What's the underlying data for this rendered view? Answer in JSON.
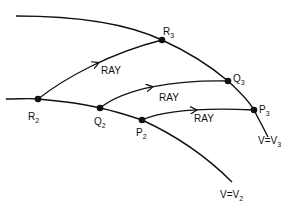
{
  "diagram": {
    "curves": {
      "front_v3_label": "V=V",
      "front_v3_sub": "3",
      "front_v2_label": "V=V",
      "front_v2_sub": "2"
    },
    "points": [
      {
        "id": "R2",
        "label": "R",
        "sub": "2"
      },
      {
        "id": "Q2",
        "label": "Q",
        "sub": "2"
      },
      {
        "id": "P2",
        "label": "P",
        "sub": "2"
      },
      {
        "id": "R3",
        "label": "R",
        "sub": "3"
      },
      {
        "id": "Q3",
        "label": "Q",
        "sub": "3"
      },
      {
        "id": "P3",
        "label": "P",
        "sub": "3"
      }
    ],
    "rays": [
      {
        "from": "R2",
        "to": "R3",
        "label": "RAY"
      },
      {
        "from": "Q2",
        "to": "Q3",
        "label": "RAY"
      },
      {
        "from": "P2",
        "to": "P3",
        "label": "RAY"
      }
    ]
  }
}
